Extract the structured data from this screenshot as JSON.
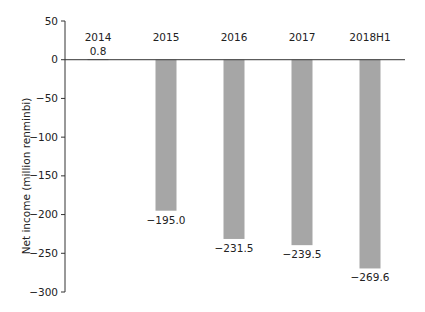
{
  "chart_data": {
    "type": "bar",
    "title": "",
    "xlabel": "",
    "ylabel": "Net income (million renminbi)",
    "categories": [
      "2014",
      "2015",
      "2016",
      "2017",
      "2018H1"
    ],
    "values": [
      0.8,
      -195.0,
      -231.5,
      -239.5,
      -269.6
    ],
    "value_labels": [
      "0.8",
      "−195.0",
      "−231.5",
      "−239.5",
      "−269.6"
    ],
    "ylim": [
      -300,
      50
    ],
    "yticks": [
      50,
      0,
      -50,
      -100,
      -150,
      -200,
      -250,
      -300
    ],
    "ytick_labels": [
      "50",
      "0",
      "−50",
      "−100",
      "−150",
      "−200",
      "−250",
      "−300"
    ],
    "grid": false,
    "legend": null,
    "bar_color": "#a6a6a6",
    "category_labels_position": "top"
  }
}
